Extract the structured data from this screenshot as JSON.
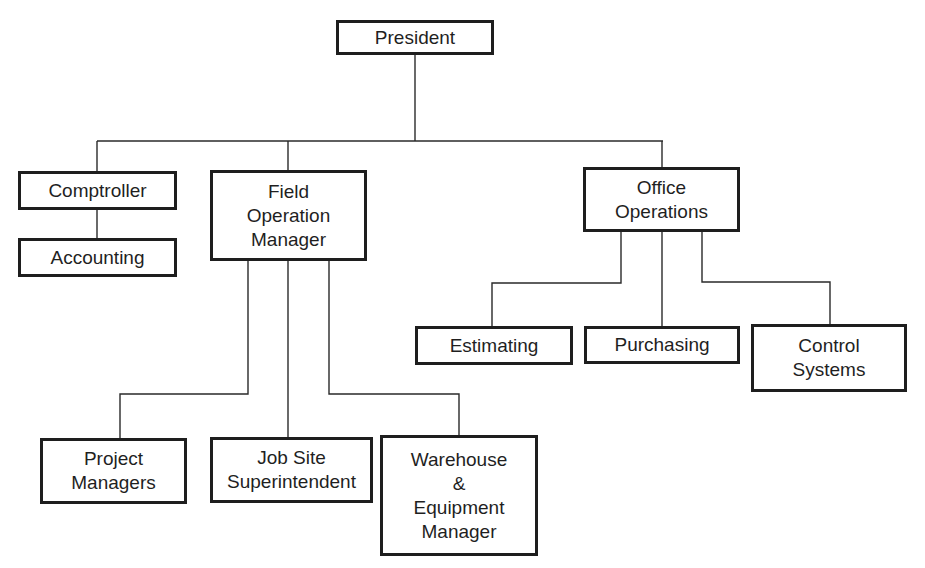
{
  "diagram": {
    "type": "org-chart",
    "nodes": {
      "president": {
        "label": "President"
      },
      "comptroller": {
        "label": "Comptroller"
      },
      "accounting": {
        "label": "Accounting"
      },
      "field_operation_manager": {
        "label": "Field\nOperation\nManager"
      },
      "office_operations": {
        "label": "Office\nOperations"
      },
      "estimating": {
        "label": "Estimating"
      },
      "purchasing": {
        "label": "Purchasing"
      },
      "control_systems": {
        "label": "Control\nSystems"
      },
      "project_managers": {
        "label": "Project\nManagers"
      },
      "job_site_superintendent": {
        "label": "Job Site\nSuperintendent"
      },
      "warehouse_equipment_manager": {
        "label": "Warehouse\n&\nEquipment\nManager"
      }
    },
    "edges": [
      {
        "from": "president",
        "to": "comptroller"
      },
      {
        "from": "president",
        "to": "field_operation_manager"
      },
      {
        "from": "president",
        "to": "office_operations"
      },
      {
        "from": "comptroller",
        "to": "accounting"
      },
      {
        "from": "field_operation_manager",
        "to": "project_managers"
      },
      {
        "from": "field_operation_manager",
        "to": "job_site_superintendent"
      },
      {
        "from": "field_operation_manager",
        "to": "warehouse_equipment_manager"
      },
      {
        "from": "office_operations",
        "to": "estimating"
      },
      {
        "from": "office_operations",
        "to": "purchasing"
      },
      {
        "from": "office_operations",
        "to": "control_systems"
      }
    ]
  }
}
